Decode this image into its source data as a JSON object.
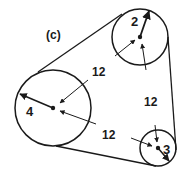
{
  "figure": {
    "label": "(c)",
    "stroke_color": "#1a1a1a",
    "background": "#ffffff"
  },
  "pulleys": [
    {
      "id": "4",
      "label": "4",
      "cx": 53,
      "cy": 108,
      "r": 38
    },
    {
      "id": "3",
      "label": "3",
      "cx": 140,
      "cy": 37,
      "r": 28
    },
    {
      "id": "2",
      "label": "2",
      "cx": 158,
      "cy": 148,
      "r": 18
    }
  ],
  "dimensions": [
    {
      "id": "dim-4-3",
      "label": "12",
      "x": 100,
      "y": 76
    },
    {
      "id": "dim-3-2",
      "label": "12",
      "x": 152,
      "y": 106
    },
    {
      "id": "dim-4-2",
      "label": "12",
      "x": 110,
      "y": 139
    }
  ]
}
